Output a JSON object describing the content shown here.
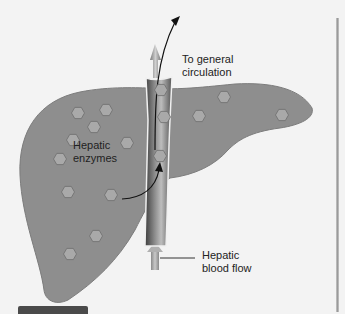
{
  "diagram": {
    "labels": {
      "to_circulation_line1": "To general",
      "to_circulation_line2": "circulation",
      "enzymes_line1": "Hepatic",
      "enzymes_line2": "enzymes",
      "blood_flow_line1": "Hepatic",
      "blood_flow_line2": "blood flow"
    },
    "colors": {
      "background": "#f3f3f3",
      "liver": "#8e8e8e",
      "liver_edge": "#7a7a7a",
      "vessel_dark": "#4d4d4d",
      "vessel_light": "#b5b5b5",
      "enzyme": "#a9a9a9",
      "arrow": "#111111"
    },
    "enzymes": [
      {
        "x": 78,
        "y": 113
      },
      {
        "x": 106,
        "y": 110
      },
      {
        "x": 94,
        "y": 127
      },
      {
        "x": 73,
        "y": 140
      },
      {
        "x": 127,
        "y": 143
      },
      {
        "x": 60,
        "y": 159
      },
      {
        "x": 68,
        "y": 192
      },
      {
        "x": 111,
        "y": 195
      },
      {
        "x": 96,
        "y": 236
      },
      {
        "x": 70,
        "y": 254
      },
      {
        "x": 161,
        "y": 90
      },
      {
        "x": 164,
        "y": 117
      },
      {
        "x": 160,
        "y": 156
      },
      {
        "x": 224,
        "y": 97
      },
      {
        "x": 199,
        "y": 116
      },
      {
        "x": 282,
        "y": 115
      }
    ]
  }
}
